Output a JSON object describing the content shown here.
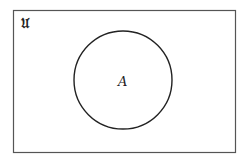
{
  "diagram": {
    "type": "venn",
    "universe_label": "ᵘ",
    "universe_symbol": "U",
    "sets": [
      {
        "label": "A"
      }
    ],
    "colors": {
      "border": "#555555",
      "circle": "#222222",
      "background": "#ffffff"
    }
  }
}
